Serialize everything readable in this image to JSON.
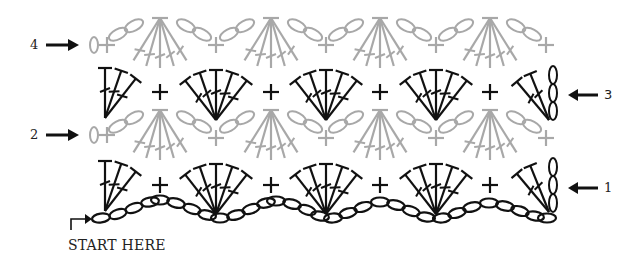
{
  "diagram": {
    "type": "crochet-stitch-chart",
    "rows": [
      {
        "number": "1",
        "label": "1",
        "direction": "right-to-left",
        "color": "#111111",
        "label_side": "right"
      },
      {
        "number": "2",
        "label": "2",
        "direction": "left-to-right",
        "color": "#a8a8a8",
        "label_side": "left"
      },
      {
        "number": "3",
        "label": "3",
        "direction": "right-to-left",
        "color": "#111111",
        "label_side": "right"
      },
      {
        "number": "4",
        "label": "4",
        "direction": "left-to-right",
        "color": "#a8a8a8",
        "label_side": "left"
      }
    ],
    "start_label": "START HERE",
    "colors": {
      "odd_rows": "#111111",
      "even_rows": "#a8a8a8",
      "background": "#ffffff"
    },
    "stitches": {
      "chain": "oval",
      "single_crochet": "plus",
      "double_crochet": "T with one slash",
      "fan": "5 double crochet in one stitch",
      "chain_space_loop": "double oval (figure eight)"
    }
  }
}
